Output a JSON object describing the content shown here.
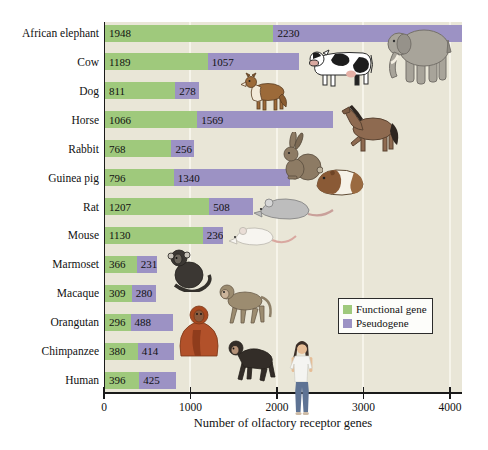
{
  "chart_data": {
    "type": "bar",
    "stacked": true,
    "orientation": "horizontal",
    "title": "",
    "xlabel": "Number of olfactory receptor genes",
    "ylabel": "",
    "categories": [
      "African elephant",
      "Cow",
      "Dog",
      "Horse",
      "Rabbit",
      "Guinea pig",
      "Rat",
      "Mouse",
      "Marmoset",
      "Macaque",
      "Orangutan",
      "Chimpanzee",
      "Human"
    ],
    "series": [
      {
        "name": "Functional gene",
        "color": "#9fc97c",
        "values": [
          1948,
          1189,
          811,
          1066,
          768,
          796,
          1207,
          1130,
          366,
          309,
          296,
          380,
          396
        ]
      },
      {
        "name": "Pseudogene",
        "color": "#9c92c4",
        "values": [
          2230,
          1057,
          278,
          1569,
          256,
          1340,
          508,
          236,
          231,
          280,
          488,
          414,
          425
        ]
      }
    ],
    "value_labels": true,
    "xticks": [
      0,
      1000,
      2000,
      3000,
      4000
    ],
    "xlim": [
      0,
      4140
    ],
    "grid": "vertical-light",
    "plot_background": "#e9e6d7",
    "gridline_color": "#f6f4ea",
    "legend_position": "middle-right"
  },
  "legend": {
    "items": [
      {
        "label": "Functional gene",
        "color": "#9fc97c"
      },
      {
        "label": "Pseudogene",
        "color": "#9c92c4"
      }
    ]
  },
  "animal_icons": [
    "african-elephant-image",
    "cow-image",
    "dog-image",
    "horse-image",
    "rabbit-image",
    "guinea-pig-image",
    "rat-image",
    "mouse-image",
    "marmoset-image",
    "macaque-image",
    "orangutan-image",
    "chimpanzee-image",
    "human-image"
  ]
}
